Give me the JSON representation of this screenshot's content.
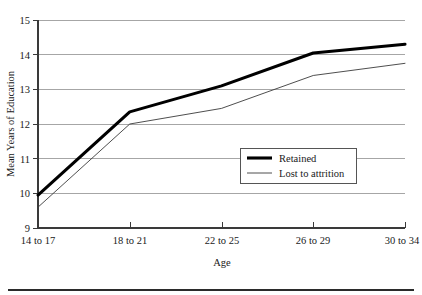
{
  "chart_data": {
    "type": "line",
    "title": "",
    "xlabel": "Age",
    "ylabel": "Mean Years of Education",
    "categories": [
      "14 to 17",
      "18 to 21",
      "22 to 25",
      "26 to 29",
      "30 to 34"
    ],
    "series": [
      {
        "name": "Retained",
        "values": [
          9.95,
          12.35,
          13.1,
          14.05,
          14.3
        ],
        "style": "thick",
        "color": "#000000"
      },
      {
        "name": "Lost to attrition",
        "values": [
          9.6,
          12.0,
          12.45,
          13.4,
          13.75
        ],
        "style": "thin",
        "color": "#3a3a3a"
      }
    ],
    "ylim": [
      9,
      15
    ],
    "yticks": [
      9,
      10,
      11,
      12,
      13,
      14,
      15
    ],
    "ytick_labels": [
      "9",
      "10",
      "11",
      "12",
      "13",
      "14",
      "15"
    ],
    "grid": true,
    "grid_axis": "y",
    "legend_position": "center-right-inside"
  },
  "axes": {
    "y_title": "Mean Years of Education",
    "x_title": "Age",
    "y_tick_labels": [
      "15",
      "14",
      "13",
      "12",
      "11",
      "10",
      "9"
    ],
    "x_tick_labels": [
      "14 to 17",
      "18 to 21",
      "22 to 25",
      "26 to 29",
      "30 to 34"
    ]
  },
  "legend": {
    "entries": [
      {
        "label": "Retained"
      },
      {
        "label": "Lost to attrition"
      }
    ]
  }
}
